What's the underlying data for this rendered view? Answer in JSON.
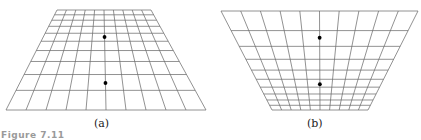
{
  "figure": {
    "label_partial": "Figure 7.11",
    "panels": [
      {
        "id": "a",
        "caption": "(a)",
        "shape": "trapezoid-narrow-top",
        "columns": 10,
        "rows": 10,
        "perspective": "rows widen toward bottom",
        "points": [
          {
            "name": "upper-point",
            "col_frac": 0.5,
            "row_frac": 0.27
          },
          {
            "name": "lower-point",
            "col_frac": 0.5,
            "row_frac": 0.73
          }
        ],
        "line_color": "#6e6e6e",
        "point_color": "#000000"
      },
      {
        "id": "b",
        "caption": "(b)",
        "shape": "trapezoid-wide-top",
        "columns": 10,
        "rows": 10,
        "perspective": "rows narrow toward bottom",
        "points": [
          {
            "name": "upper-point",
            "col_frac": 0.5,
            "row_frac": 0.27
          },
          {
            "name": "lower-point",
            "col_frac": 0.5,
            "row_frac": 0.74
          }
        ],
        "line_color": "#6e6e6e",
        "point_color": "#000000"
      }
    ]
  }
}
